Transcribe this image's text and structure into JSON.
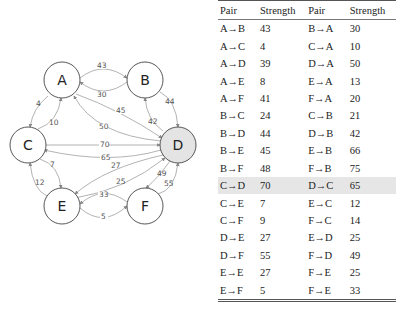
{
  "graph": {
    "nodes": [
      {
        "id": "A",
        "label": "A",
        "x": 62,
        "y": 80,
        "highlight": false
      },
      {
        "id": "B",
        "label": "B",
        "x": 145,
        "y": 80,
        "highlight": false
      },
      {
        "id": "C",
        "label": "C",
        "x": 28,
        "y": 145,
        "highlight": false
      },
      {
        "id": "D",
        "label": "D",
        "x": 178,
        "y": 145,
        "highlight": true
      },
      {
        "id": "E",
        "label": "E",
        "x": 62,
        "y": 206,
        "highlight": false
      },
      {
        "id": "F",
        "label": "F",
        "x": 145,
        "y": 206,
        "highlight": false
      }
    ],
    "edge_labels": {
      "AB": "43",
      "BA": "30",
      "AC": "4",
      "CA": "10",
      "AD": "45",
      "DA": "50",
      "BD": "44",
      "DB": "42",
      "CD": "70",
      "DC": "65",
      "DE": "27",
      "ED": "25",
      "CE": "7",
      "EC": "12",
      "DF": "49",
      "FD": "55",
      "FE": "33",
      "EF": "5"
    },
    "colors": {
      "node_fill": "#ffffff",
      "node_fill_highlight": "#e4e4e4",
      "node_stroke": "#444444",
      "edge": "#999999"
    }
  },
  "table": {
    "headers": [
      "Pair",
      "Strength",
      "Pair",
      "Strength"
    ],
    "rows": [
      [
        "A→B",
        "43",
        "B→A",
        "30"
      ],
      [
        "A→C",
        "4",
        "C→A",
        "10"
      ],
      [
        "A→D",
        "39",
        "D→A",
        "50"
      ],
      [
        "A→E",
        "8",
        "E→A",
        "13"
      ],
      [
        "A→F",
        "41",
        "F→A",
        "20"
      ],
      [
        "B→C",
        "24",
        "C→B",
        "21"
      ],
      [
        "B→D",
        "44",
        "D→B",
        "42"
      ],
      [
        "B→E",
        "45",
        "E→B",
        "66"
      ],
      [
        "B→F",
        "48",
        "F→B",
        "75"
      ],
      [
        "C→D",
        "70",
        "D→C",
        "65"
      ],
      [
        "C→E",
        "7",
        "E→C",
        "12"
      ],
      [
        "C→F",
        "9",
        "F→C",
        "14"
      ],
      [
        "D→E",
        "27",
        "E→D",
        "25"
      ],
      [
        "D→F",
        "55",
        "F→D",
        "49"
      ],
      [
        "E→E",
        "27",
        "F→E",
        "25"
      ],
      [
        "E→F",
        "5",
        "F→E",
        "33"
      ]
    ],
    "highlight_row_index": 9,
    "highlight_color": "#e6e6e6"
  }
}
